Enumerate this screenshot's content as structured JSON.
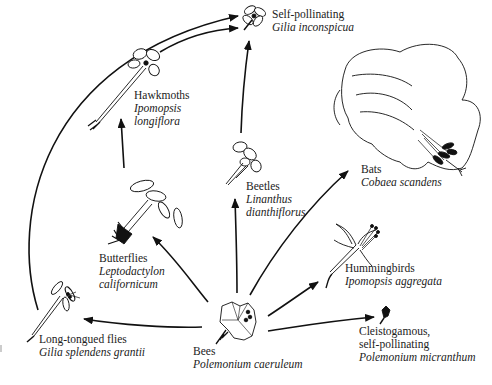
{
  "diagram": {
    "type": "evolutionary-transition-network",
    "center_node": "bees",
    "nodes": [
      {
        "id": "self-pollinating-top",
        "pollinator": "Self-pollinating",
        "species": "Gilia inconspicua"
      },
      {
        "id": "hawkmoths",
        "pollinator": "Hawkmoths",
        "species_line1": "Ipomopsis",
        "species_line2": "longiflora"
      },
      {
        "id": "beetles",
        "pollinator": "Beetles",
        "species_line1": "Linanthus",
        "species_line2": "dianthiflorus"
      },
      {
        "id": "bats",
        "pollinator": "Bats",
        "species": "Cobaea scandens"
      },
      {
        "id": "butterflies",
        "pollinator": "Butterflies",
        "species_line1": "Leptodactylon",
        "species_line2": "californicum"
      },
      {
        "id": "hummingbirds",
        "pollinator": "Hummingbirds",
        "species": "Ipomopsis aggregata"
      },
      {
        "id": "long-tongued-flies",
        "pollinator": "Long-tongued flies",
        "species": "Gilia splendens grantii"
      },
      {
        "id": "bees",
        "pollinator": "Bees",
        "species": "Polemonium caeruleum"
      },
      {
        "id": "cleistogamous",
        "pollinator_line1": "Cleistogamous,",
        "pollinator_line2": "self-pollinating",
        "species": "Polemonium micranthum"
      }
    ],
    "edges": [
      {
        "from": "bees",
        "to": "long-tongued-flies"
      },
      {
        "from": "bees",
        "to": "butterflies"
      },
      {
        "from": "bees",
        "to": "beetles"
      },
      {
        "from": "bees",
        "to": "bats"
      },
      {
        "from": "bees",
        "to": "hummingbirds"
      },
      {
        "from": "bees",
        "to": "cleistogamous"
      },
      {
        "from": "butterflies",
        "to": "hawkmoths"
      },
      {
        "from": "beetles",
        "to": "self-pollinating-top"
      },
      {
        "from": "hawkmoths",
        "to": "self-pollinating-top"
      },
      {
        "from": "long-tongued-flies",
        "to": "self-pollinating-top"
      }
    ],
    "colors": {
      "line": "#111111",
      "background": "#ffffff",
      "text": "#222222"
    }
  }
}
